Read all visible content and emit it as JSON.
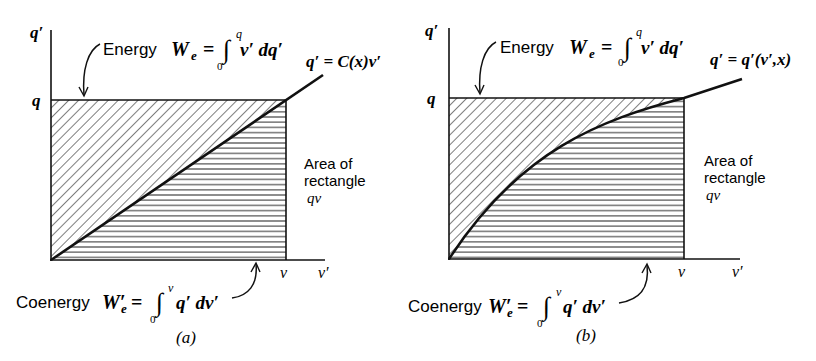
{
  "panels": [
    {
      "id": "a",
      "caption": "(a)",
      "y_axis_label": "q′",
      "x_axis_label": "v′",
      "q_tick": "q",
      "v_tick": "v",
      "energy_word": "Energy",
      "energy_symbol": "W",
      "energy_sub": "e",
      "energy_eq": "=",
      "energy_lower": "0",
      "energy_upper": "q",
      "energy_integrand": "v′ dq′",
      "curve_label": "q′ = C(x)v′",
      "curve_type": "linear",
      "area_label_1": "Area of",
      "area_label_2": "rectangle",
      "area_label_3": "qv",
      "coenergy_word": "Coenergy",
      "coenergy_symbol": "W′",
      "coenergy_sub": "e",
      "coenergy_eq": "=",
      "coenergy_lower": "0",
      "coenergy_upper": "v",
      "coenergy_integrand": "q′ dv′"
    },
    {
      "id": "b",
      "caption": "(b)",
      "y_axis_label": "q′",
      "x_axis_label": "v′",
      "q_tick": "q",
      "v_tick": "v",
      "energy_word": "Energy",
      "energy_symbol": "W",
      "energy_sub": "e",
      "energy_eq": "=",
      "energy_lower": "0",
      "energy_upper": "q",
      "energy_integrand": "v′ dq′",
      "curve_label": "q′ = q′(v′,x)",
      "curve_type": "concave",
      "area_label_1": "Area of",
      "area_label_2": "rectangle",
      "area_label_3": "qv",
      "coenergy_word": "Coenergy",
      "coenergy_symbol": "W′",
      "coenergy_sub": "e",
      "coenergy_eq": "=",
      "coenergy_lower": "0",
      "coenergy_upper": "v",
      "coenergy_integrand": "q′ dv′"
    }
  ],
  "legend": {
    "diagonal_hatch": "energy region (above curve)",
    "horizontal_hatch": "coenergy region (below curve)"
  }
}
